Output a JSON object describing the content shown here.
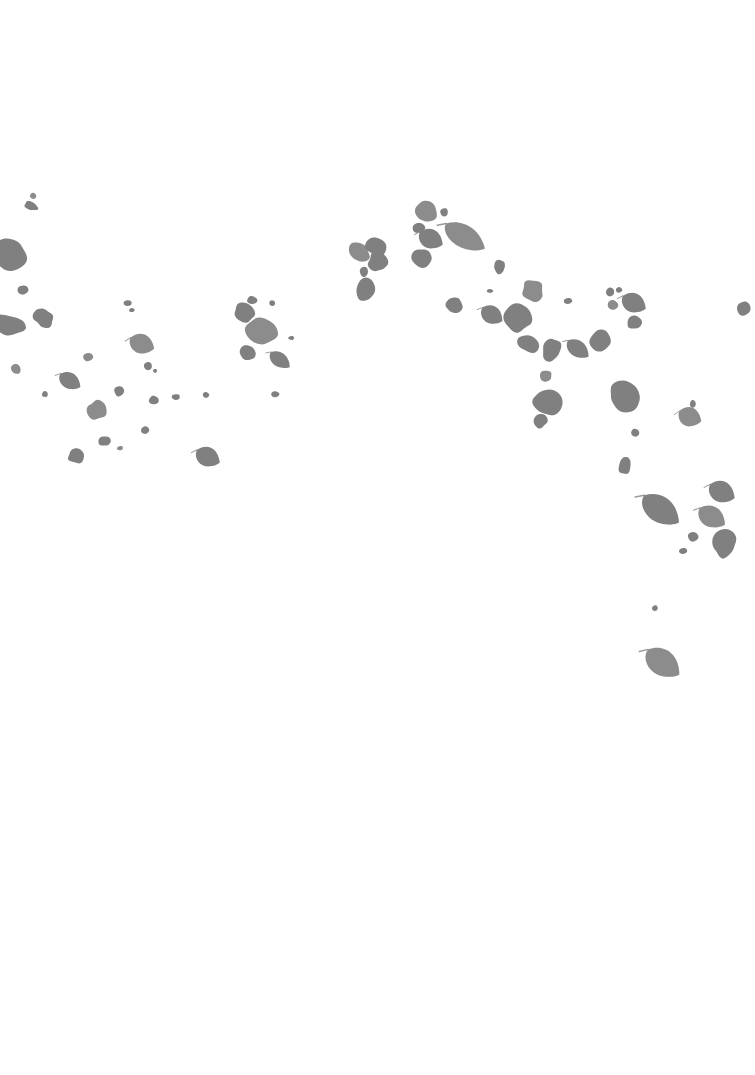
{
  "page": {
    "width": 755,
    "height": 1075,
    "background_color": "#ffffff"
  },
  "artwork": {
    "name": "scattered-leaves",
    "leaf_color": "#808080",
    "leaf_color_light": "#8c8c8c",
    "stem_color": "#9a9a9a",
    "total_shapes": 78,
    "arrangement": "arc",
    "arc_description": "Shapes rise from the lower-left edge, crest near the upper-center, and descend toward the lower-right corner.",
    "clusters": [
      {
        "id": "left-edge",
        "label": "Left edge cluster",
        "x_range": [
          0,
          80
        ],
        "y_range": [
          190,
          400
        ],
        "count": 8
      },
      {
        "id": "left-lower",
        "label": "Lower-left scatter",
        "x_range": [
          60,
          230
        ],
        "y_range": [
          300,
          480
        ],
        "count": 14
      },
      {
        "id": "mid-left",
        "label": "Mid-left cluster",
        "x_range": [
          230,
          300
        ],
        "y_range": [
          290,
          400
        ],
        "count": 7
      },
      {
        "id": "upper-center",
        "label": "Upper center crest",
        "x_range": [
          340,
          500
        ],
        "y_range": [
          195,
          310
        ],
        "count": 13
      },
      {
        "id": "mid-right",
        "label": "Mid-right cluster",
        "x_range": [
          480,
          640
        ],
        "y_range": [
          260,
          430
        ],
        "count": 18
      },
      {
        "id": "right-edge",
        "label": "Right edge cluster",
        "x_range": [
          600,
          755
        ],
        "y_range": [
          280,
          570
        ],
        "count": 15
      },
      {
        "id": "lower-right",
        "label": "Lower-right trailing leaf",
        "x_range": [
          630,
          700
        ],
        "y_range": [
          590,
          690
        ],
        "count": 3
      }
    ],
    "shapes": [
      {
        "cx": 33,
        "cy": 196,
        "rx": 3,
        "ry": 3,
        "rot": 10,
        "type": "speck"
      },
      {
        "cx": 31,
        "cy": 206,
        "rx": 7,
        "ry": 4,
        "rot": 25,
        "type": "petal"
      },
      {
        "cx": 9,
        "cy": 255,
        "rx": 19,
        "ry": 15,
        "rot": 15,
        "type": "blob"
      },
      {
        "cx": 23,
        "cy": 290,
        "rx": 5,
        "ry": 5,
        "rot": 0,
        "type": "speck"
      },
      {
        "cx": 8,
        "cy": 325,
        "rx": 17,
        "ry": 10,
        "rot": 12,
        "type": "petal"
      },
      {
        "cx": 16,
        "cy": 369,
        "rx": 5,
        "ry": 5,
        "rot": 0,
        "type": "speck"
      },
      {
        "cx": 44,
        "cy": 318,
        "rx": 10,
        "ry": 9,
        "rot": 20,
        "type": "leaf"
      },
      {
        "cx": 45,
        "cy": 394,
        "rx": 3,
        "ry": 3,
        "rot": 0,
        "type": "speck"
      },
      {
        "cx": 70,
        "cy": 381,
        "rx": 12,
        "ry": 10,
        "rot": 30,
        "type": "leaf"
      },
      {
        "cx": 76,
        "cy": 456,
        "rx": 8,
        "ry": 7,
        "rot": 15,
        "type": "petal"
      },
      {
        "cx": 97,
        "cy": 410,
        "rx": 10,
        "ry": 9,
        "rot": 35,
        "type": "leaf"
      },
      {
        "cx": 104,
        "cy": 441,
        "rx": 6,
        "ry": 5,
        "rot": 0,
        "type": "petal"
      },
      {
        "cx": 119,
        "cy": 391,
        "rx": 5,
        "ry": 5,
        "rot": 0,
        "type": "speck"
      },
      {
        "cx": 128,
        "cy": 303,
        "rx": 4,
        "ry": 3,
        "rot": 0,
        "type": "speck"
      },
      {
        "cx": 132,
        "cy": 310,
        "rx": 3,
        "ry": 2,
        "rot": 0,
        "type": "speck"
      },
      {
        "cx": 142,
        "cy": 344,
        "rx": 13,
        "ry": 12,
        "rot": 20,
        "type": "leaf"
      },
      {
        "cx": 145,
        "cy": 430,
        "rx": 4,
        "ry": 4,
        "rot": 0,
        "type": "speck"
      },
      {
        "cx": 148,
        "cy": 366,
        "rx": 4,
        "ry": 4,
        "rot": 0,
        "type": "speck"
      },
      {
        "cx": 155,
        "cy": 371,
        "rx": 2,
        "ry": 2,
        "rot": 0,
        "type": "speck"
      },
      {
        "cx": 154,
        "cy": 400,
        "rx": 5,
        "ry": 4,
        "rot": 0,
        "type": "speck"
      },
      {
        "cx": 120,
        "cy": 448,
        "rx": 3,
        "ry": 2,
        "rot": 0,
        "type": "speck"
      },
      {
        "cx": 208,
        "cy": 457,
        "rx": 13,
        "ry": 12,
        "rot": 25,
        "type": "leaf"
      },
      {
        "cx": 176,
        "cy": 397,
        "rx": 4,
        "ry": 3,
        "rot": 0,
        "type": "speck"
      },
      {
        "cx": 244,
        "cy": 313,
        "rx": 11,
        "ry": 9,
        "rot": 40,
        "type": "leaf"
      },
      {
        "cx": 252,
        "cy": 300,
        "rx": 5,
        "ry": 4,
        "rot": 0,
        "type": "speck"
      },
      {
        "cx": 262,
        "cy": 330,
        "rx": 16,
        "ry": 13,
        "rot": 20,
        "type": "blob"
      },
      {
        "cx": 248,
        "cy": 353,
        "rx": 9,
        "ry": 7,
        "rot": 30,
        "type": "petal"
      },
      {
        "cx": 280,
        "cy": 360,
        "rx": 12,
        "ry": 9,
        "rot": 35,
        "type": "leaf"
      },
      {
        "cx": 275,
        "cy": 394,
        "rx": 4,
        "ry": 3,
        "rot": 0,
        "type": "speck"
      },
      {
        "cx": 291,
        "cy": 338,
        "rx": 3,
        "ry": 2,
        "rot": 0,
        "type": "speck"
      },
      {
        "cx": 359,
        "cy": 252,
        "rx": 11,
        "ry": 9,
        "rot": 30,
        "type": "leaf"
      },
      {
        "cx": 376,
        "cy": 247,
        "rx": 10,
        "ry": 9,
        "rot": 15,
        "type": "leaf"
      },
      {
        "cx": 378,
        "cy": 262,
        "rx": 10,
        "ry": 9,
        "rot": 40,
        "type": "leaf"
      },
      {
        "cx": 364,
        "cy": 272,
        "rx": 4,
        "ry": 5,
        "rot": 0,
        "type": "speck"
      },
      {
        "cx": 366,
        "cy": 289,
        "rx": 9,
        "ry": 12,
        "rot": 10,
        "type": "leaf"
      },
      {
        "cx": 425,
        "cy": 212,
        "rx": 11,
        "ry": 10,
        "rot": 30,
        "type": "leaf"
      },
      {
        "cx": 419,
        "cy": 228,
        "rx": 6,
        "ry": 5,
        "rot": 0,
        "type": "petal"
      },
      {
        "cx": 444,
        "cy": 212,
        "rx": 4,
        "ry": 4,
        "rot": 0,
        "type": "speck"
      },
      {
        "cx": 431,
        "cy": 239,
        "rx": 13,
        "ry": 12,
        "rot": 25,
        "type": "leaf"
      },
      {
        "cx": 422,
        "cy": 258,
        "rx": 10,
        "ry": 9,
        "rot": 40,
        "type": "petal"
      },
      {
        "cx": 465,
        "cy": 237,
        "rx": 23,
        "ry": 14,
        "rot": 30,
        "type": "leaf"
      },
      {
        "cx": 500,
        "cy": 267,
        "rx": 5,
        "ry": 7,
        "rot": 10,
        "type": "petal"
      },
      {
        "cx": 490,
        "cy": 291,
        "rx": 3,
        "ry": 2,
        "rot": 0,
        "type": "speck"
      },
      {
        "cx": 454,
        "cy": 305,
        "rx": 8,
        "ry": 8,
        "rot": 20,
        "type": "leaf"
      },
      {
        "cx": 492,
        "cy": 315,
        "rx": 12,
        "ry": 11,
        "rot": 30,
        "type": "leaf"
      },
      {
        "cx": 533,
        "cy": 291,
        "rx": 11,
        "ry": 10,
        "rot": 35,
        "type": "leaf"
      },
      {
        "cx": 519,
        "cy": 318,
        "rx": 14,
        "ry": 13,
        "rot": 20,
        "type": "blob"
      },
      {
        "cx": 528,
        "cy": 344,
        "rx": 11,
        "ry": 8,
        "rot": 25,
        "type": "petal"
      },
      {
        "cx": 551,
        "cy": 350,
        "rx": 9,
        "ry": 12,
        "rot": 15,
        "type": "leaf"
      },
      {
        "cx": 578,
        "cy": 349,
        "rx": 13,
        "ry": 10,
        "rot": 35,
        "type": "leaf"
      },
      {
        "cx": 546,
        "cy": 376,
        "rx": 6,
        "ry": 5,
        "rot": 0,
        "type": "petal"
      },
      {
        "cx": 547,
        "cy": 402,
        "rx": 14,
        "ry": 13,
        "rot": 20,
        "type": "blob"
      },
      {
        "cx": 540,
        "cy": 421,
        "rx": 7,
        "ry": 7,
        "rot": 0,
        "type": "petal"
      },
      {
        "cx": 610,
        "cy": 292,
        "rx": 4,
        "ry": 4,
        "rot": 0,
        "type": "speck"
      },
      {
        "cx": 619,
        "cy": 290,
        "rx": 3,
        "ry": 3,
        "rot": 0,
        "type": "speck"
      },
      {
        "cx": 613,
        "cy": 305,
        "rx": 5,
        "ry": 5,
        "rot": 0,
        "type": "speck"
      },
      {
        "cx": 634,
        "cy": 303,
        "rx": 13,
        "ry": 12,
        "rot": 25,
        "type": "leaf"
      },
      {
        "cx": 634,
        "cy": 322,
        "rx": 7,
        "ry": 7,
        "rot": 0,
        "type": "petal"
      },
      {
        "cx": 601,
        "cy": 340,
        "rx": 10,
        "ry": 12,
        "rot": 15,
        "type": "leaf"
      },
      {
        "cx": 625,
        "cy": 396,
        "rx": 16,
        "ry": 14,
        "rot": 25,
        "type": "blob"
      },
      {
        "cx": 690,
        "cy": 417,
        "rx": 12,
        "ry": 12,
        "rot": 20,
        "type": "leaf"
      },
      {
        "cx": 635,
        "cy": 433,
        "rx": 4,
        "ry": 4,
        "rot": 0,
        "type": "speck"
      },
      {
        "cx": 625,
        "cy": 465,
        "rx": 6,
        "ry": 9,
        "rot": 10,
        "type": "petal"
      },
      {
        "cx": 661,
        "cy": 510,
        "rx": 22,
        "ry": 16,
        "rot": 35,
        "type": "leaf"
      },
      {
        "cx": 722,
        "cy": 492,
        "rx": 14,
        "ry": 13,
        "rot": 25,
        "type": "leaf"
      },
      {
        "cx": 712,
        "cy": 517,
        "rx": 15,
        "ry": 13,
        "rot": 30,
        "type": "leaf"
      },
      {
        "cx": 724,
        "cy": 543,
        "rx": 13,
        "ry": 14,
        "rot": 15,
        "type": "blob"
      },
      {
        "cx": 693,
        "cy": 537,
        "rx": 5,
        "ry": 5,
        "rot": 0,
        "type": "speck"
      },
      {
        "cx": 683,
        "cy": 551,
        "rx": 4,
        "ry": 3,
        "rot": 0,
        "type": "speck"
      },
      {
        "cx": 655,
        "cy": 608,
        "rx": 3,
        "ry": 3,
        "rot": 0,
        "type": "speck"
      },
      {
        "cx": 663,
        "cy": 663,
        "rx": 20,
        "ry": 16,
        "rot": 35,
        "type": "leaf"
      },
      {
        "cx": 744,
        "cy": 308,
        "rx": 6,
        "ry": 7,
        "rot": 20,
        "type": "petal"
      },
      {
        "cx": 568,
        "cy": 301,
        "rx": 4,
        "ry": 3,
        "rot": 0,
        "type": "speck"
      },
      {
        "cx": 499,
        "cy": 266,
        "rx": 5,
        "ry": 6,
        "rot": 0,
        "type": "petal"
      },
      {
        "cx": 206,
        "cy": 395,
        "rx": 3,
        "ry": 3,
        "rot": 0,
        "type": "speck"
      },
      {
        "cx": 88,
        "cy": 357,
        "rx": 5,
        "ry": 4,
        "rot": 0,
        "type": "speck"
      },
      {
        "cx": 272,
        "cy": 303,
        "rx": 3,
        "ry": 3,
        "rot": 0,
        "type": "speck"
      },
      {
        "cx": 693,
        "cy": 404,
        "rx": 3,
        "ry": 4,
        "rot": 0,
        "type": "speck"
      }
    ]
  },
  "caption": {
    "text": ""
  }
}
